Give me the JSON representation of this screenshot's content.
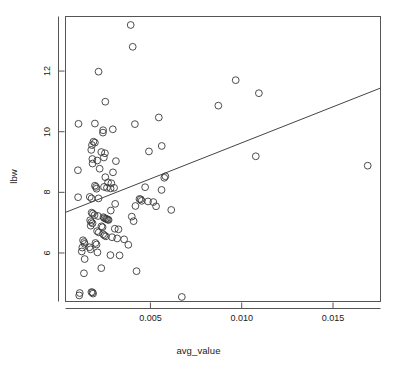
{
  "figure": {
    "title": "",
    "background": "#ffffff",
    "width": 397,
    "height": 369
  },
  "axes": {
    "x_title": "avg_value",
    "y_title": "lbw",
    "x_ticks": [
      "0.005",
      "0.010",
      "0.015"
    ],
    "y_ticks": [
      "6",
      "8",
      "10",
      "12"
    ],
    "frame_color": "#555555",
    "point_color": "#3a3a3a",
    "line_color": "#444444"
  },
  "chart_data": {
    "type": "scatter",
    "title": "",
    "xlabel": "avg_value",
    "ylabel": "lbw",
    "xlim": [
      0.00035,
      0.0176
    ],
    "ylim": [
      4.4,
      13.8
    ],
    "grid": false,
    "legend": null,
    "xticks": [
      0.005,
      0.01,
      0.015
    ],
    "yticks": [
      6,
      8,
      10,
      12
    ],
    "marker": "open-circle",
    "marker_size": 3.4,
    "series": [
      {
        "name": "observations",
        "points": [
          [
            0.00392,
            13.52
          ],
          [
            0.00403,
            12.8
          ],
          [
            0.00216,
            11.98
          ],
          [
            0.00967,
            11.7
          ],
          [
            0.01094,
            11.27
          ],
          [
            0.00872,
            10.86
          ],
          [
            0.00253,
            10.99
          ],
          [
            0.00546,
            10.47
          ],
          [
            0.00106,
            10.26
          ],
          [
            0.00196,
            10.27
          ],
          [
            0.00415,
            10.25
          ],
          [
            0.00241,
            10.05
          ],
          [
            0.0024,
            9.97
          ],
          [
            0.00294,
            10.08
          ],
          [
            0.00188,
            9.67
          ],
          [
            0.00196,
            9.64
          ],
          [
            0.0018,
            9.56
          ],
          [
            0.00562,
            9.53
          ],
          [
            0.00176,
            9.4
          ],
          [
            0.00231,
            9.33
          ],
          [
            0.00251,
            9.29
          ],
          [
            0.00492,
            9.35
          ],
          [
            0.00182,
            9.1
          ],
          [
            0.00245,
            9.15
          ],
          [
            0.00209,
            9.05
          ],
          [
            0.00183,
            8.95
          ],
          [
            0.00311,
            9.03
          ],
          [
            0.01077,
            9.19
          ],
          [
            0.0169,
            8.88
          ],
          [
            0.00103,
            8.73
          ],
          [
            0.00222,
            8.78
          ],
          [
            0.00295,
            8.66
          ],
          [
            0.00253,
            8.5
          ],
          [
            0.00582,
            8.53
          ],
          [
            0.00576,
            8.48
          ],
          [
            0.00268,
            8.33
          ],
          [
            0.00286,
            8.3
          ],
          [
            0.00196,
            8.22
          ],
          [
            0.00202,
            8.18
          ],
          [
            0.00205,
            8.12
          ],
          [
            0.00246,
            8.18
          ],
          [
            0.00262,
            8.15
          ],
          [
            0.00282,
            8.13
          ],
          [
            0.00301,
            8.15
          ],
          [
            0.00471,
            8.17
          ],
          [
            0.00561,
            8.08
          ],
          [
            0.00104,
            7.84
          ],
          [
            0.00168,
            7.85
          ],
          [
            0.00178,
            7.8
          ],
          [
            0.00216,
            7.8
          ],
          [
            0.0044,
            7.78
          ],
          [
            0.00447,
            7.77
          ],
          [
            0.00452,
            7.72
          ],
          [
            0.00487,
            7.7
          ],
          [
            0.00516,
            7.68
          ],
          [
            0.00307,
            7.62
          ],
          [
            0.00418,
            7.55
          ],
          [
            0.00531,
            7.54
          ],
          [
            0.00614,
            7.42
          ],
          [
            0.00283,
            7.4
          ],
          [
            0.00178,
            7.33
          ],
          [
            0.00185,
            7.3
          ],
          [
            0.00194,
            7.25
          ],
          [
            0.00213,
            7.22
          ],
          [
            0.00243,
            7.18
          ],
          [
            0.00248,
            7.15
          ],
          [
            0.00255,
            7.13
          ],
          [
            0.00261,
            7.12
          ],
          [
            0.00266,
            7.1
          ],
          [
            0.00271,
            7.09
          ],
          [
            0.0017,
            7.08
          ],
          [
            0.00176,
            7.02
          ],
          [
            0.00183,
            6.98
          ],
          [
            0.00398,
            7.2
          ],
          [
            0.00408,
            7.05
          ],
          [
            0.00173,
            6.9
          ],
          [
            0.00232,
            6.88
          ],
          [
            0.00238,
            6.85
          ],
          [
            0.00305,
            6.8
          ],
          [
            0.00325,
            6.78
          ],
          [
            0.00208,
            6.72
          ],
          [
            0.00217,
            6.68
          ],
          [
            0.00241,
            6.62
          ],
          [
            0.00248,
            6.58
          ],
          [
            0.00256,
            6.55
          ],
          [
            0.0029,
            6.52
          ],
          [
            0.00318,
            6.48
          ],
          [
            0.00356,
            6.45
          ],
          [
            0.00131,
            6.42
          ],
          [
            0.00137,
            6.36
          ],
          [
            0.0014,
            6.3
          ],
          [
            0.00199,
            6.33
          ],
          [
            0.00205,
            6.28
          ],
          [
            0.00379,
            6.27
          ],
          [
            0.00127,
            6.18
          ],
          [
            0.00166,
            6.19
          ],
          [
            0.00172,
            6.12
          ],
          [
            0.00124,
            6.05
          ],
          [
            0.0021,
            6.02
          ],
          [
            0.00281,
            5.93
          ],
          [
            0.00331,
            5.92
          ],
          [
            0.0014,
            5.8
          ],
          [
            0.00231,
            5.5
          ],
          [
            0.00136,
            5.33
          ],
          [
            0.00424,
            5.4
          ],
          [
            0.00113,
            4.68
          ],
          [
            0.00177,
            4.71
          ],
          [
            0.00183,
            4.7
          ],
          [
            0.00186,
            4.66
          ],
          [
            0.0011,
            4.6
          ],
          [
            0.00672,
            4.55
          ]
        ]
      }
    ],
    "regression_line": {
      "x_start": 0.00035,
      "y_start": 7.34,
      "x_end": 0.0176,
      "y_end": 11.44
    }
  }
}
